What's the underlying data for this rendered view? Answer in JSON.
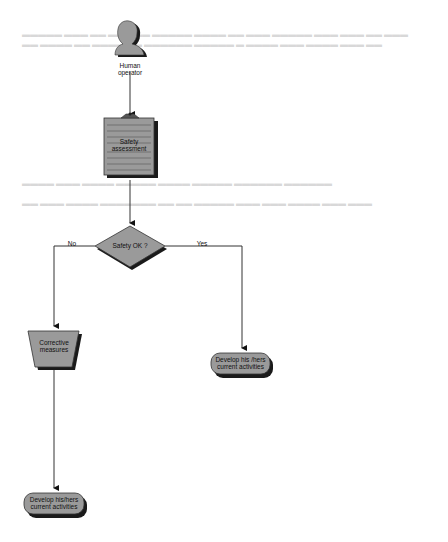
{
  "diagram": {
    "type": "flowchart",
    "nodes": {
      "operator": {
        "label_line1": "Human",
        "label_line2": "operator",
        "shape": "person-icon"
      },
      "assessment": {
        "label_line1": "Safety",
        "label_line2": "assessment",
        "shape": "clipboard"
      },
      "decision": {
        "label": "Safety OK ?",
        "shape": "diamond"
      },
      "corrective": {
        "label_line1": "Corrective",
        "label_line2": "measures",
        "shape": "trapezoid"
      },
      "develop_yes": {
        "label_line1": "Develop his /hers",
        "label_line2": "current activities",
        "shape": "rounded-terminal"
      },
      "develop_no": {
        "label_line1": "Develop his/hers",
        "label_line2": "current activities",
        "shape": "rounded-terminal"
      }
    },
    "edges": {
      "no_label": "No",
      "yes_label": "Yes"
    },
    "colors": {
      "shape_fill": "#9a9a9a",
      "shadow": "#1a1a1a",
      "line": "#333333",
      "faint_text": "#d8d8d8"
    }
  }
}
